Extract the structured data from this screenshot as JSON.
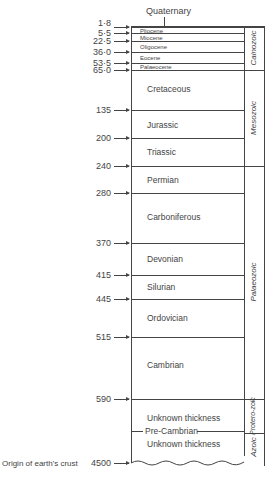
{
  "diagram": {
    "top_label": "Quaternary",
    "unit": "million years",
    "boundaries": [
      {
        "age": "1·8",
        "y": 27
      },
      {
        "age": "5·5",
        "y": 33
      },
      {
        "age": "22·5",
        "y": 41
      },
      {
        "age": "36·0",
        "y": 52
      },
      {
        "age": "53·5",
        "y": 63
      },
      {
        "age": "65·0",
        "y": 70
      },
      {
        "age": "135",
        "y": 110
      },
      {
        "age": "200",
        "y": 138
      },
      {
        "age": "240",
        "y": 166
      },
      {
        "age": "280",
        "y": 193
      },
      {
        "age": "370",
        "y": 243
      },
      {
        "age": "415",
        "y": 275
      },
      {
        "age": "445",
        "y": 299
      },
      {
        "age": "515",
        "y": 337
      },
      {
        "age": "590",
        "y": 399
      },
      {
        "age": "4500",
        "y": 463
      }
    ],
    "epochs": [
      "Pliocene",
      "Miocene",
      "Oligocene",
      "Eocene",
      "Palaeocene"
    ],
    "periods": [
      "Cretaceous",
      "Jurassic",
      "Triassic",
      "Permian",
      "Carboniferous",
      "Devonian",
      "Silurian",
      "Ordovician",
      "Cambrian"
    ],
    "precambrian": {
      "upper": "Unknown thickness",
      "divider": "Pre-Cambrian",
      "lower": "Unknown thickness"
    },
    "eras": [
      "Cainozoic",
      "Mesozoic",
      "Palaeozoic",
      "Protero-zoic",
      "Azoic"
    ],
    "origin_label": "Origin of earth's crust"
  }
}
